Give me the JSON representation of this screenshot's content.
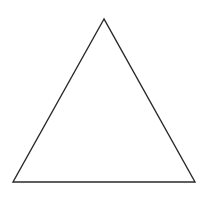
{
  "diagram": {
    "shape": "triangle",
    "type": "equilateral",
    "vertices": [
      {
        "name": "apex",
        "x": 104,
        "y": 19
      },
      {
        "name": "bottom-left",
        "x": 13,
        "y": 182
      },
      {
        "name": "bottom-right",
        "x": 195,
        "y": 182
      }
    ],
    "stroke_color": "#2a2a2a",
    "fill_color": "#ffffff",
    "background_color": "#ffffff",
    "stroke_width": 1.4
  }
}
